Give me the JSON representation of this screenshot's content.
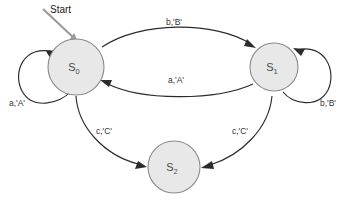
{
  "diagram": {
    "title_label": "Start",
    "background_color": "#ffffff",
    "state_fill_color": "#e8e8e8",
    "state_stroke_color": "#8a8a8a",
    "edge_color": "#2b2b2b",
    "start_arrow_color": "#9a9a9a",
    "states": [
      {
        "id": "s0",
        "label": "S",
        "subscript": "0"
      },
      {
        "id": "s1",
        "label": "S",
        "subscript": "1"
      },
      {
        "id": "s2",
        "label": "S",
        "subscript": "2"
      }
    ],
    "transitions": [
      {
        "id": "t-s0-s1-top",
        "from": "S0",
        "to": "S1",
        "label": "b,'B'"
      },
      {
        "id": "t-s1-s0-mid",
        "from": "S1",
        "to": "S0",
        "label": "a,'A'"
      },
      {
        "id": "t-s0-self",
        "from": "S0",
        "to": "S0",
        "label": "a,'A'"
      },
      {
        "id": "t-s1-self",
        "from": "S1",
        "to": "S1",
        "label": "b,'B'"
      },
      {
        "id": "t-s0-s2",
        "from": "S0",
        "to": "S2",
        "label": "c,'C'"
      },
      {
        "id": "t-s1-s2",
        "from": "S1",
        "to": "S2",
        "label": "c,'C'"
      }
    ]
  }
}
